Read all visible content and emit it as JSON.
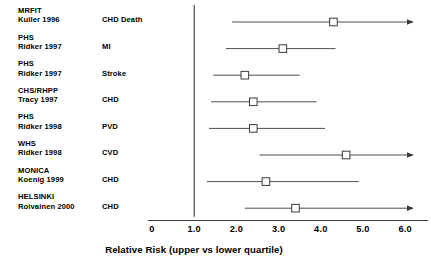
{
  "chart_data": {
    "type": "scatter",
    "title": "",
    "xlabel": "Relative Risk (upper vs lower quartile)",
    "ylabel": "",
    "xlim": [
      0,
      6.4
    ],
    "grid": false,
    "legend": null,
    "reference_line": 1.0,
    "x_tick_labels": [
      "0",
      "1.0",
      "2.0",
      "3.0",
      "4.0",
      "5.0",
      "6.0"
    ],
    "x_tick_values": [
      0,
      1,
      2,
      3,
      4,
      5,
      6
    ],
    "marker": "open-square",
    "columns": [
      "Study",
      "Author",
      "Outcome",
      "Relative Risk",
      "CI Low",
      "CI High"
    ],
    "rows": [
      {
        "study": "MRFIT",
        "author": "Kuller 1996",
        "outcome": "CHD Death",
        "rr": 4.3,
        "ci_low": 1.9,
        "ci_high": 6.3,
        "ci_high_truncated": true
      },
      {
        "study": "PHS",
        "author": "Ridker 1997",
        "outcome": "MI",
        "rr": 3.1,
        "ci_low": 1.75,
        "ci_high": 4.35,
        "ci_high_truncated": false
      },
      {
        "study": "PHS",
        "author": "Ridker 1997",
        "outcome": "Stroke",
        "rr": 2.2,
        "ci_low": 1.45,
        "ci_high": 3.5,
        "ci_high_truncated": false
      },
      {
        "study": "CHS/RHPP",
        "author": "Tracy 1997",
        "outcome": "CHD",
        "rr": 2.4,
        "ci_low": 1.4,
        "ci_high": 3.9,
        "ci_high_truncated": false
      },
      {
        "study": "PHS",
        "author": "Ridker 1998",
        "outcome": "PVD",
        "rr": 2.4,
        "ci_low": 1.35,
        "ci_high": 4.1,
        "ci_high_truncated": false
      },
      {
        "study": "WHS",
        "author": "Ridker 1998",
        "outcome": "CVD",
        "rr": 4.6,
        "ci_low": 2.55,
        "ci_high": 6.3,
        "ci_high_truncated": true
      },
      {
        "study": "MONICA",
        "author": "Koenig 1999",
        "outcome": "CHD",
        "rr": 2.7,
        "ci_low": 1.3,
        "ci_high": 4.9,
        "ci_high_truncated": false
      },
      {
        "study": "HELSINKI",
        "author": "Roivainen 2000",
        "outcome": "CHD",
        "rr": 3.4,
        "ci_low": 2.2,
        "ci_high": 6.3,
        "ci_high_truncated": true
      }
    ]
  },
  "colors": {
    "line": "#3a3a3a",
    "marker_fill": "#ffffff",
    "marker_stroke": "#3a3a3a",
    "axis": "#3a3a3a",
    "text": "#000000"
  }
}
